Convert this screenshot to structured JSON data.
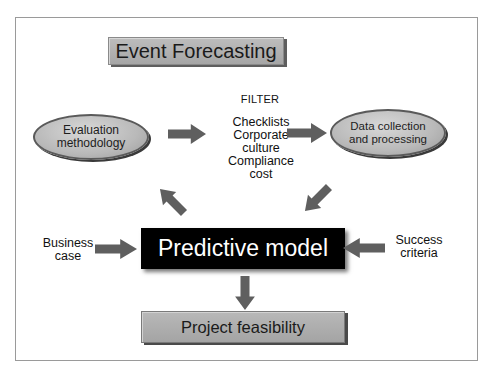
{
  "diagram": {
    "title": "Event Forecasting",
    "nodes": {
      "evaluation": "Evaluation methodology",
      "evaluation_lines": [
        "Evaluation",
        "methodology"
      ],
      "data_collection_lines": [
        "Data collection",
        "and processing"
      ],
      "filter_title": "FILTER",
      "filter_items": [
        "Checklists",
        "Corporate",
        "culture",
        "Compliance",
        "cost"
      ],
      "predictive_model": "Predictive model",
      "business_case_lines": [
        "Business",
        "case"
      ],
      "success_criteria_lines": [
        "Success",
        "criteria"
      ],
      "project_feasibility": "Project feasibility"
    },
    "edges": [
      {
        "from": "Evaluation methodology",
        "to": "FILTER"
      },
      {
        "from": "FILTER",
        "to": "Data collection and processing"
      },
      {
        "from": "Data collection and processing",
        "to": "Predictive model"
      },
      {
        "from": "Predictive model",
        "to": "Evaluation methodology"
      },
      {
        "from": "Business case",
        "to": "Predictive model"
      },
      {
        "from": "Success criteria",
        "to": "Predictive model"
      },
      {
        "from": "Predictive model",
        "to": "Project feasibility"
      }
    ],
    "colors": {
      "arrow": "#5f5f5f",
      "box_fill": "#b0b0b0",
      "model_fill": "#000000",
      "frame": "#9a9a9a"
    }
  }
}
